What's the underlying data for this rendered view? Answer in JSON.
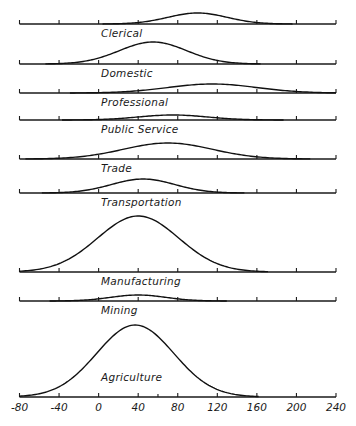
{
  "chart_data": {
    "type": "area",
    "title": "",
    "xlabel": "",
    "ylabel": "",
    "xlim": [
      -80,
      240
    ],
    "x_ticks": [
      -80,
      -40,
      0,
      40,
      80,
      120,
      160,
      200,
      240
    ],
    "x_tick_labels": [
      "-80",
      "-40",
      "0",
      "40",
      "80",
      "120",
      "160",
      "200",
      "240"
    ],
    "grid": false,
    "legend": "none",
    "height_units": "relative frequency (arbitrary units, Agriculture peak = 72)",
    "series": [
      {
        "name": "Clerical",
        "mean": 100,
        "sigma": 30,
        "peak": 11
      },
      {
        "name": "Domestic",
        "mean": 55,
        "sigma": 34,
        "peak": 22
      },
      {
        "name": "Professional",
        "mean": 115,
        "sigma": 45,
        "peak": 9
      },
      {
        "name": "Public Service",
        "mean": 75,
        "sigma": 35,
        "peak": 5
      },
      {
        "name": "Trade",
        "mean": 70,
        "sigma": 45,
        "peak": 16
      },
      {
        "name": "Transportation",
        "mean": 45,
        "sigma": 32,
        "peak": 14
      },
      {
        "name": "Manufacturing",
        "mean": 40,
        "sigma": 41,
        "peak": 56
      },
      {
        "name": "Mining",
        "mean": 40,
        "sigma": 28,
        "peak": 6
      },
      {
        "name": "Agriculture",
        "mean": 37,
        "sigma": 39,
        "peak": 72
      }
    ]
  }
}
